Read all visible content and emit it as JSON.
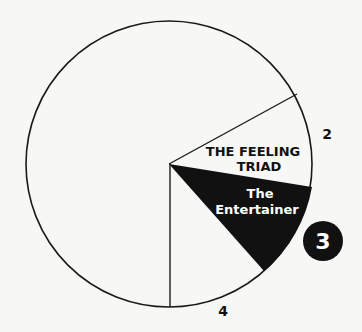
{
  "diagram": {
    "title": "The Feeling Triad",
    "center": {
      "x": 169,
      "y": 164
    },
    "radius": 143,
    "colors": {
      "background": "#f7f7f5",
      "stroke": "#1a1a1a",
      "wedge_fill": "#111111",
      "wedge_text": "#ffffff",
      "label_text": "#111111"
    },
    "segment_label": {
      "line1": "THE FEELING",
      "line2": "TRIAD"
    },
    "highlight_wedge": {
      "line1": "The",
      "line2": "Entertainer"
    },
    "numbers": {
      "two": "2",
      "three": "3",
      "four": "4"
    }
  }
}
